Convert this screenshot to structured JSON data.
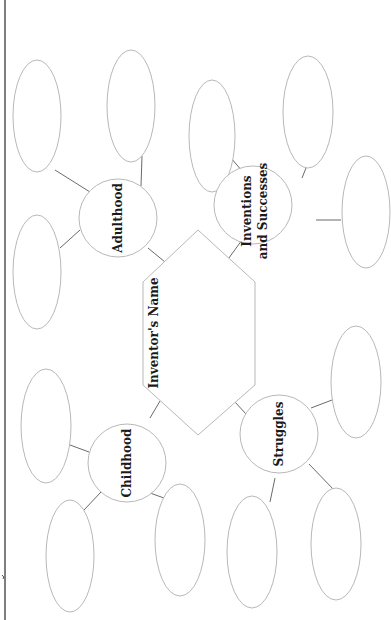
{
  "diagram": {
    "type": "graphic-organizer",
    "orientation": "rotated-90-ccw",
    "center": {
      "label": "Inventor's Name",
      "shape": "hexagon"
    },
    "nodes": [
      {
        "id": "adulthood",
        "label": "Adulthood",
        "blank_bubbles": 3
      },
      {
        "id": "inventions",
        "label_line1": "Inventions",
        "label_line2": "and Successes",
        "blank_bubbles": 3
      },
      {
        "id": "childhood",
        "label": "Childhood",
        "blank_bubbles": 3
      },
      {
        "id": "struggles",
        "label": "Struggles",
        "blank_bubbles": 3
      }
    ],
    "colors": {
      "outline": "#b8b8b8",
      "connector": "#6a6a6a",
      "text": "#1a1a1a",
      "background": "#ffffff"
    }
  }
}
